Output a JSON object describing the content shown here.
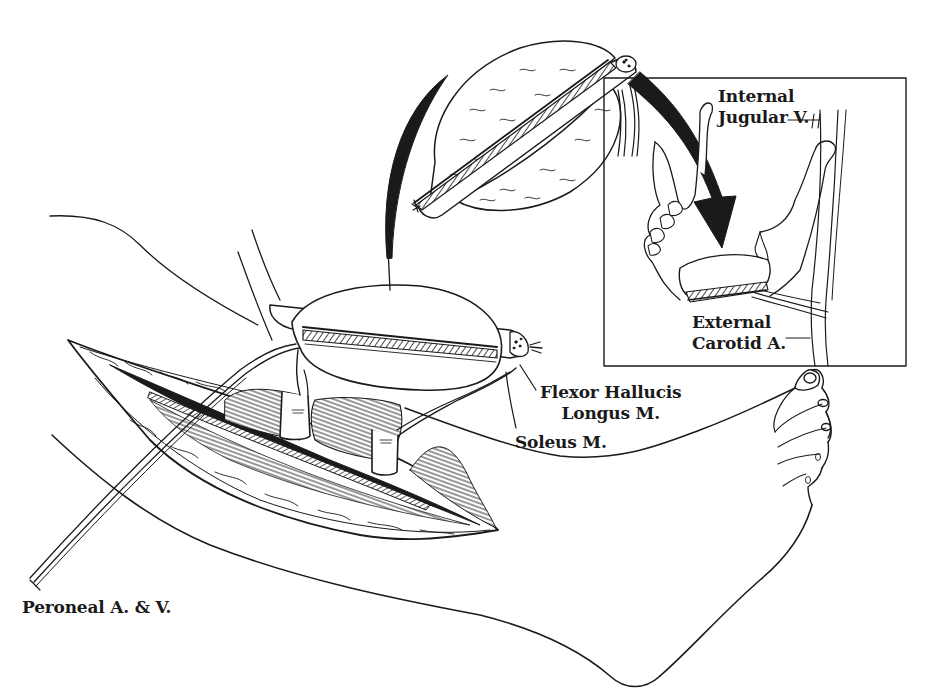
{
  "figure": {
    "colors": {
      "ink": "#1a1a1a",
      "background": "#ffffff"
    }
  },
  "labels": {
    "internal_jugular": {
      "line1": "Internal",
      "line2": "Jugular V."
    },
    "external_carotid": {
      "line1": "External",
      "line2": "Carotid A."
    },
    "flexor_hallucis": {
      "line1": "Flexor Hallucis",
      "line2": "Longus M."
    },
    "soleus": {
      "line1": "Soleus M."
    },
    "peroneal": {
      "line1": "Peroneal A. & V."
    }
  },
  "inset": {
    "name": "mandible-reconstruction-inset",
    "box": {
      "x": 604,
      "y": 78,
      "width": 302,
      "height": 288
    }
  }
}
